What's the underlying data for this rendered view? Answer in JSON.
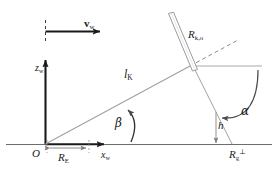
{
  "figure": {
    "width": 278,
    "height": 169,
    "background_color": "#ffffff"
  },
  "colors": {
    "ink": "#1a1a1a",
    "axis": "#1a1a1a",
    "thin_line": "#8c8c8c",
    "mid_line": "#5a5a5a",
    "rod_outline": "#9a9a9a",
    "baseline": "#6e6e6e"
  },
  "labels": {
    "velocity": {
      "symbol": "v",
      "subscript": "w",
      "bold": true,
      "name": "wind velocity vector"
    },
    "z_axis": {
      "symbol": "z",
      "subscript": "w",
      "name": "z axis of wind frame"
    },
    "x_axis": {
      "symbol": "x",
      "subscript": "w",
      "name": "x axis of wind frame"
    },
    "origin": {
      "symbol": "O",
      "name": "origin"
    },
    "cable_length": {
      "symbol": "l",
      "subscript": "K",
      "name": "cable length"
    },
    "radius_ko": {
      "symbol": "R",
      "subscript": "k,o",
      "name": "rotor radius k,o"
    },
    "radius_ground": {
      "symbol": "R",
      "subscript": "E",
      "name": "ground radius"
    },
    "radius_perp": {
      "symbol": "R",
      "subscript": "g",
      "superscript": "⊥",
      "name": "perpendicular ground radius"
    },
    "height": {
      "symbol": "h",
      "name": "height"
    },
    "angle_alpha": {
      "symbol": "α",
      "name": "angle alpha"
    },
    "angle_beta": {
      "symbol": "β",
      "name": "angle beta"
    }
  },
  "elements": {
    "baseline": "horizontal ground line",
    "vertical_axis": "z_w axis arrow pointing up",
    "velocity_arrow": "horizontal arrow pointing right labeled v_w",
    "diagonal_line": "line l_K from origin to intersection point",
    "dashed_extension": "dashed continuation of l_K beyond intersection",
    "rod": "tilted elongated rod at top",
    "horizontal_ray": "horizontal reference line at intersection height",
    "alpha_arc": "curved arrow marking angle alpha",
    "beta_arc": "curved arrow marking angle beta",
    "height_arrow": "vertical arrow marking h",
    "dimension_re": "double-headed dimension arrow marking R_E",
    "dashed_tick": "short vertical dashed tick above velocity arrow tail"
  }
}
